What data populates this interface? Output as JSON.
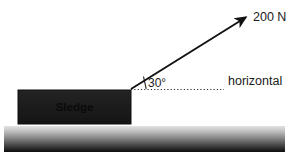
{
  "diagram": {
    "force": {
      "label": "200 N",
      "magnitude": 200,
      "unit": "N",
      "angle_label": "30°",
      "angle_degrees": 30,
      "arrow_color": "#111111",
      "origin": {
        "x": 131,
        "y": 89
      },
      "tip": {
        "x": 248,
        "y": 16
      }
    },
    "reference_line": {
      "label": "horizontal",
      "style": "dotted",
      "color": "#333333",
      "y": 89,
      "x_start": 131,
      "x_end": 224
    },
    "block": {
      "label": "Sledge",
      "fill_color": "#1c1c1c",
      "text_color": "#0a0a0a",
      "x": 18,
      "y": 90,
      "width": 113,
      "height": 34
    },
    "ground": {
      "label": "ground",
      "gradient_top_color": "#d8d8d8",
      "gradient_bottom_color": "#0d0d0d",
      "x": 4,
      "y": 126,
      "width": 281,
      "height": 26
    },
    "background_color": "#ffffff"
  }
}
